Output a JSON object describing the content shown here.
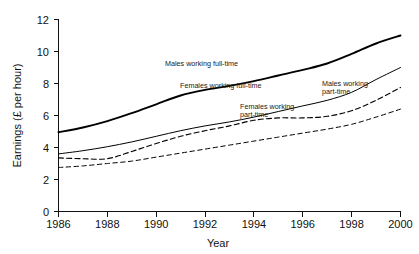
{
  "chart_data": {
    "type": "line",
    "title": "",
    "subtitle": "",
    "xlabel": "Year",
    "ylabel": "Earnings (£ per hour)",
    "xlim": [
      1986,
      2000
    ],
    "ylim": [
      0,
      12
    ],
    "grid": false,
    "legend_position": "inline-annotations",
    "x_ticks": [
      "1986",
      "1988",
      "1990",
      "1992",
      "1994",
      "1996",
      "1998",
      "2000"
    ],
    "y_ticks": [
      "0",
      "2",
      "4",
      "6",
      "8",
      "10",
      "12"
    ],
    "x": [
      1986,
      1987,
      1988,
      1989,
      1990,
      1991,
      1992,
      1993,
      1994,
      1995,
      1996,
      1997,
      1998,
      1999,
      2000
    ],
    "series": [
      {
        "name": "Males working full-time",
        "style": "solid-thick",
        "values": [
          4.95,
          5.25,
          5.65,
          6.15,
          6.7,
          7.25,
          7.6,
          7.85,
          8.15,
          8.5,
          8.85,
          9.25,
          9.85,
          10.5,
          11.0
        ]
      },
      {
        "name": "Females working full-time",
        "style": "solid-thin",
        "values": [
          3.6,
          3.8,
          4.05,
          4.35,
          4.7,
          5.05,
          5.35,
          5.6,
          5.9,
          6.25,
          6.6,
          6.95,
          7.45,
          8.25,
          9.0
        ]
      },
      {
        "name": "Males working part-time",
        "style": "dashed",
        "values": [
          3.35,
          3.3,
          3.3,
          3.75,
          4.25,
          4.7,
          5.05,
          5.35,
          5.7,
          5.85,
          5.85,
          5.95,
          6.3,
          6.95,
          7.75
        ]
      },
      {
        "name": "Females working part-time",
        "style": "dashed",
        "values": [
          2.75,
          2.85,
          3.0,
          3.15,
          3.4,
          3.65,
          3.9,
          4.15,
          4.4,
          4.65,
          4.9,
          5.15,
          5.45,
          5.9,
          6.4
        ]
      }
    ],
    "annotations": [
      {
        "id": "males-full-time",
        "lines": [
          "Males working full-time"
        ]
      },
      {
        "id": "females-full-time",
        "lines": [
          "Females working full-time"
        ]
      },
      {
        "id": "males-part-time",
        "lines": [
          "Males working",
          "part-time"
        ]
      },
      {
        "id": "females-part-time",
        "lines": [
          "Females working",
          "part-time"
        ]
      }
    ],
    "colors": {
      "axis": "#111111",
      "line": "#000000",
      "background": "#ffffff"
    }
  }
}
